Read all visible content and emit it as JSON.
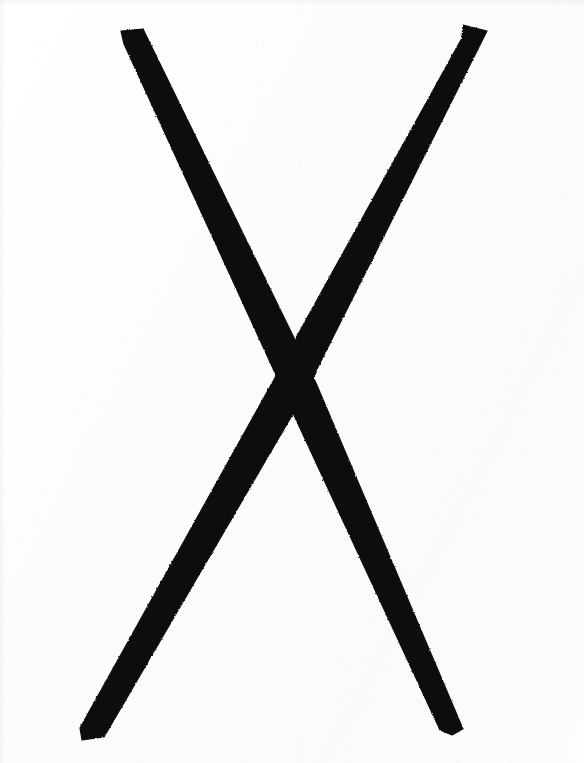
{
  "image": {
    "kind": "scanned-drawing",
    "subject": "hand-drawn X mark",
    "caption": "",
    "width": 584,
    "height": 763,
    "background_color": "#fcfcfc",
    "ink_color": "#100e0e",
    "alt_text": "A large hand-drawn black X made of two thick crossing brush strokes on off-white paper"
  },
  "strokes": [
    {
      "id": "stroke-downward-right",
      "name": "top-left-to-bottom-right-stroke",
      "color": "#100e0e",
      "start": {
        "x": 131,
        "y": 30
      },
      "end": {
        "x": 472,
        "y": 730
      },
      "width_px": 20,
      "outline_points": "121,31 143,29 299,348 316,383 463,729 452,735 440,730 286,398 281,386 124,44"
    },
    {
      "id": "stroke-downward-left",
      "name": "top-right-to-bottom-left-stroke",
      "color": "#100e0e",
      "start": {
        "x": 475,
        "y": 26
      },
      "end": {
        "x": 93,
        "y": 740
      },
      "width_px": 20,
      "outline_points": "463,25 487,31 318,367 311,383 104,737 82,740 80,728 291,349 296,338 462,38"
    }
  ],
  "geometry": {
    "intersection": {
      "x": 298,
      "y": 358
    },
    "stroke_count": 2
  }
}
